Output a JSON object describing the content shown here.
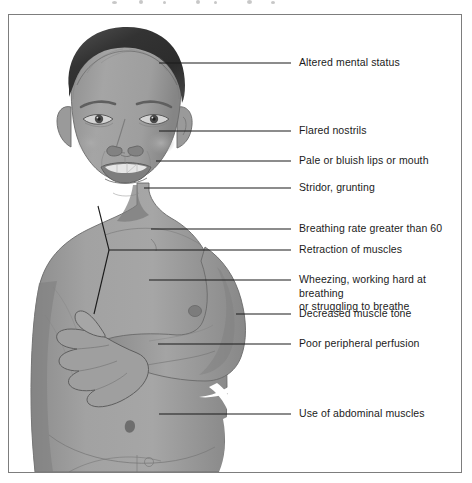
{
  "figure": {
    "subject_description": "Grayscale medical illustration of a young child's head, chest, arm and abdomen, shown from the front, used to point out physical signs of respiratory distress.",
    "frame": {
      "border_color": "#7d7d7d",
      "background": "#ffffff"
    },
    "palette": {
      "skin": "#9a9a9a",
      "skin_light": "#b0b0b0",
      "skin_shadow": "#7f7f7f",
      "hair": "#3a3a3a",
      "hair_highlight": "#5c5c5c",
      "outline": "#5a5a5a",
      "leader_line": "#1a1a1a",
      "lips": "#8a8a8a",
      "teeth": "#e8e8e8",
      "eye_white": "#d8d8d8",
      "iris": "#4a4a4a"
    }
  },
  "callouts": [
    {
      "id": "altered-mental-status",
      "text": "Altered mental status"
    },
    {
      "id": "flared-nostrils",
      "text": "Flared nostrils"
    },
    {
      "id": "pale-bluish-lips",
      "text": "Pale or bluish lips or mouth"
    },
    {
      "id": "stridor-grunting",
      "text": "Stridor, grunting"
    },
    {
      "id": "breathing-rate",
      "text": "Breathing rate greater than 60"
    },
    {
      "id": "retraction-of-muscles",
      "text": "Retraction of muscles"
    },
    {
      "id": "wheezing-working-hard",
      "text": "Wheezing, working hard at breathing\nor struggling to breathe"
    },
    {
      "id": "decreased-muscle-tone",
      "text": "Decreased muscle tone"
    },
    {
      "id": "poor-peripheral-perfusion",
      "text": "Poor peripheral perfusion"
    },
    {
      "id": "use-of-abdominal-muscles",
      "text": "Use of abdominal muscles"
    }
  ]
}
